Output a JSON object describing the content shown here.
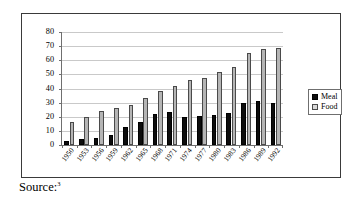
{
  "chart_data": {
    "type": "bar",
    "title": "",
    "xlabel": "",
    "ylabel": "",
    "ylim": [
      0,
      80
    ],
    "yticks": [
      0,
      10,
      20,
      30,
      40,
      50,
      60,
      70,
      80
    ],
    "grid": true,
    "legend_position": "right",
    "categories": [
      "1950",
      "1953",
      "1956",
      "1959",
      "1962",
      "1965",
      "1968",
      "1971",
      "1974",
      "1977",
      "1980",
      "1983",
      "1986",
      "1989",
      "1992"
    ],
    "series": [
      {
        "name": "Meal",
        "color": "#0d0d0d",
        "values": [
          3,
          4,
          5,
          7,
          13,
          16,
          22,
          23.5,
          19.5,
          20.5,
          21.5,
          23,
          29.5,
          31.5,
          29.5
        ]
      },
      {
        "name": "Food",
        "color": "#b5b5b5",
        "values": [
          16,
          20,
          24,
          26,
          28,
          33,
          38,
          41.5,
          46,
          47.5,
          51.5,
          55.5,
          65,
          68,
          69
        ]
      }
    ]
  },
  "legend": {
    "items": [
      {
        "label": "Meal",
        "swatch": "black-square-icon"
      },
      {
        "label": "Food",
        "swatch": "light-square-icon"
      }
    ]
  },
  "footer": {
    "source_label": "Source:",
    "footnote_marker": "3"
  }
}
